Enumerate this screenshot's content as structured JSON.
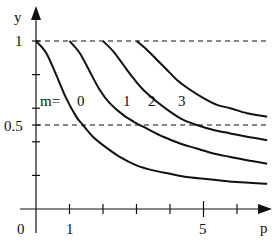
{
  "chart_data": {
    "type": "line",
    "title": "",
    "xlabel": "p",
    "ylabel": "y",
    "xlim": [
      0,
      7
    ],
    "ylim": [
      0,
      1.1
    ],
    "x_ticks": [
      1,
      2,
      3,
      4,
      5,
      6
    ],
    "x_tick_labels": [
      {
        "value": 0,
        "label": "0"
      },
      {
        "value": 1,
        "label": "1"
      },
      {
        "value": 5,
        "label": "5"
      }
    ],
    "y_ticks": [
      0.2,
      0.4,
      0.5,
      0.6,
      0.8,
      1.0
    ],
    "y_tick_labels": [
      {
        "value": 1,
        "label": "1"
      },
      {
        "value": 0.5,
        "label": "0.5"
      }
    ],
    "reference_lines": [
      {
        "y": 1.0,
        "style": "dashed"
      },
      {
        "y": 0.5,
        "style": "dashed"
      }
    ],
    "legend_prefix": "m=",
    "series": [
      {
        "name": "0",
        "label_pos": [
          1.0,
          0.6
        ],
        "points": [
          [
            0,
            1.0
          ],
          [
            0.3,
            0.93
          ],
          [
            0.6,
            0.8
          ],
          [
            0.9,
            0.66
          ],
          [
            1.2,
            0.55
          ],
          [
            1.4,
            0.5
          ],
          [
            1.7,
            0.43
          ],
          [
            2.0,
            0.38
          ],
          [
            2.5,
            0.31
          ],
          [
            3.0,
            0.26
          ],
          [
            3.5,
            0.23
          ],
          [
            4.0,
            0.21
          ],
          [
            4.5,
            0.19
          ],
          [
            5.0,
            0.18
          ],
          [
            5.5,
            0.17
          ],
          [
            6.0,
            0.16
          ],
          [
            6.9,
            0.15
          ]
        ]
      },
      {
        "name": "1",
        "label_pos": [
          2.5,
          0.6
        ],
        "points": [
          [
            1,
            1.0
          ],
          [
            1.3,
            0.93
          ],
          [
            1.6,
            0.82
          ],
          [
            1.9,
            0.71
          ],
          [
            2.2,
            0.63
          ],
          [
            2.6,
            0.56
          ],
          [
            3.0,
            0.51
          ],
          [
            3.3,
            0.48
          ],
          [
            3.8,
            0.43
          ],
          [
            4.3,
            0.39
          ],
          [
            4.8,
            0.36
          ],
          [
            5.3,
            0.33
          ],
          [
            5.8,
            0.31
          ],
          [
            6.3,
            0.29
          ],
          [
            6.9,
            0.27
          ]
        ]
      },
      {
        "name": "2",
        "label_pos": [
          3.5,
          0.6
        ],
        "points": [
          [
            2,
            1.0
          ],
          [
            2.3,
            0.94
          ],
          [
            2.6,
            0.86
          ],
          [
            2.9,
            0.78
          ],
          [
            3.2,
            0.71
          ],
          [
            3.6,
            0.64
          ],
          [
            4.0,
            0.58
          ],
          [
            4.4,
            0.53
          ],
          [
            4.8,
            0.5
          ],
          [
            5.3,
            0.47
          ],
          [
            5.8,
            0.45
          ],
          [
            6.3,
            0.43
          ],
          [
            6.9,
            0.41
          ]
        ]
      },
      {
        "name": "3",
        "label_pos": [
          4.5,
          0.6
        ],
        "points": [
          [
            3,
            1.0
          ],
          [
            3.3,
            0.95
          ],
          [
            3.6,
            0.89
          ],
          [
            3.9,
            0.83
          ],
          [
            4.2,
            0.77
          ],
          [
            4.6,
            0.71
          ],
          [
            5.0,
            0.66
          ],
          [
            5.4,
            0.62
          ],
          [
            5.8,
            0.6
          ],
          [
            6.3,
            0.57
          ],
          [
            6.9,
            0.55
          ]
        ]
      }
    ],
    "grid": false,
    "legend_position": "inline"
  },
  "labels": {
    "x_axis": "p",
    "y_axis": "y",
    "origin": "0",
    "x_one": "1",
    "x_five": "5",
    "y_one": "1",
    "y_half": "0.5",
    "legend_prefix": "m=",
    "m0": "0",
    "m1": "1",
    "m2": "2",
    "m3": "3"
  }
}
